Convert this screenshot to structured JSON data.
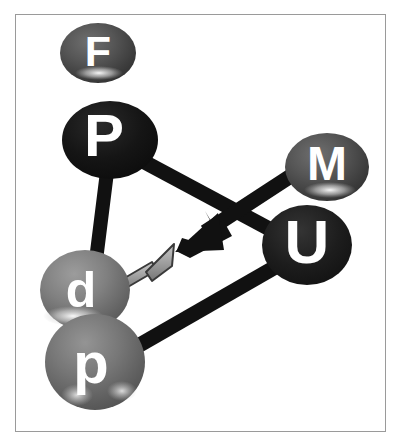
{
  "figure": {
    "background_color": "#ffffff",
    "frame_color": "#9a9a9a",
    "label_color": "#ffffff"
  },
  "nodes": [
    {
      "id": "F",
      "label": "F",
      "cx": 98,
      "cy": 53,
      "rx": 38,
      "ry": 30,
      "fill": "#4e4e4e",
      "shade": "dark-gray",
      "highlight": "bottom"
    },
    {
      "id": "P",
      "label": "P",
      "cx": 110,
      "cy": 140,
      "rx": 48,
      "ry": 39,
      "fill": "#1a1a1a",
      "shade": "black",
      "highlight": "none"
    },
    {
      "id": "M",
      "label": "M",
      "cx": 327,
      "cy": 167,
      "rx": 42,
      "ry": 34,
      "fill": "#565656",
      "shade": "dark-gray",
      "highlight": "bottom"
    },
    {
      "id": "U",
      "label": "U",
      "cx": 307,
      "cy": 245,
      "rx": 45,
      "ry": 40,
      "fill": "#222222",
      "shade": "near-black",
      "highlight": "none"
    },
    {
      "id": "d",
      "label": "d",
      "cx": 85,
      "cy": 290,
      "rx": 45,
      "ry": 40,
      "fill": "#787878",
      "shade": "medium-gray",
      "highlight": "bottom-left"
    },
    {
      "id": "p",
      "label": "p",
      "cx": 95,
      "cy": 362,
      "rx": 50,
      "ry": 48,
      "fill": "#6e6e6e",
      "shade": "medium-gray",
      "highlight": "bottom-two-spots"
    }
  ],
  "edges": [
    {
      "id": "edge-P-d",
      "from": "P",
      "to": "d",
      "color": "#111111",
      "width": 14
    },
    {
      "id": "edge-P-U",
      "from": "P",
      "to": "U",
      "color": "#111111",
      "width": 15
    },
    {
      "id": "edge-p-U",
      "from": "p",
      "to": "U",
      "color": "#111111",
      "width": 15
    }
  ],
  "arrows": [
    {
      "id": "arrow-M-center",
      "from": "M",
      "label": "large black arrow pointing down-left",
      "color": "#111111",
      "outline": "#111111",
      "x1": 296,
      "y1": 172,
      "x2": 179,
      "y2": 249,
      "head_width": 38,
      "head_length": 34,
      "shaft_width": 15
    },
    {
      "id": "arrow-d-center",
      "from": "d",
      "label": "small gray arrow pointing up-right",
      "color": "#9d9d9d",
      "outline": "#3a3a3a",
      "x1": 117,
      "y1": 278,
      "x2": 168,
      "y2": 248,
      "head_width": 22,
      "head_length": 20,
      "shaft_width": 9
    }
  ]
}
